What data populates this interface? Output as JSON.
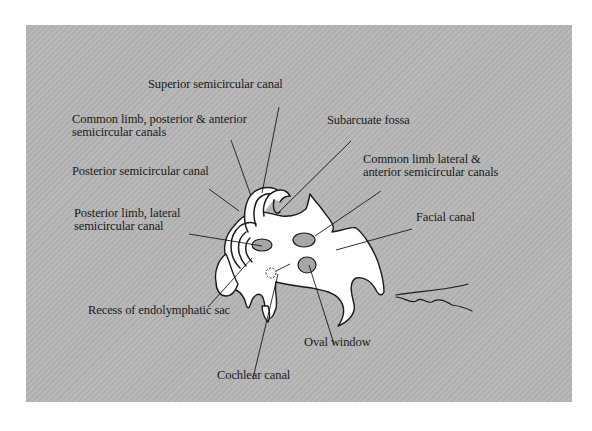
{
  "figure": {
    "panel_color": "#b5b5b5",
    "bone_color": "#ffffff",
    "outline_color": "#1a1a1a",
    "cavity_color": "#9a9a9a"
  },
  "labels": [
    {
      "id": "superior-semicircular-canal",
      "lines": [
        "Superior semicircular canal"
      ],
      "x": 148,
      "y": 88,
      "leader": [
        279,
        107,
        262,
        193
      ]
    },
    {
      "id": "common-limb-posterior-anterior",
      "lines": [
        "Common limb, posterior &  anterior",
        "semicircular canals"
      ],
      "x": 72,
      "y": 123,
      "leader": [
        231,
        140,
        251,
        196
      ]
    },
    {
      "id": "subarcuate-fossa",
      "lines": [
        "Subarcuate fossa"
      ],
      "x": 327,
      "y": 124,
      "leader": [
        351,
        141,
        278,
        213
      ]
    },
    {
      "id": "common-limb-lateral-anterior",
      "lines": [
        "Common limb lateral &",
        "anterior semicircular canals"
      ],
      "x": 363,
      "y": 163,
      "leader": [
        381,
        191,
        315,
        236
      ]
    },
    {
      "id": "posterior-semicircular-canal",
      "lines": [
        "Posterior semicircular canal"
      ],
      "x": 72,
      "y": 175,
      "leader": [
        209,
        189,
        239,
        211
      ]
    },
    {
      "id": "posterior-limb-lateral",
      "lines": [
        "Posterior limb, lateral",
        "semicircular canal"
      ],
      "x": 74,
      "y": 217,
      "leader": [
        189,
        234,
        262,
        246
      ]
    },
    {
      "id": "facial-canal",
      "lines": [
        "Facial canal"
      ],
      "x": 416,
      "y": 221,
      "leader": [
        412,
        229,
        336,
        250
      ]
    },
    {
      "id": "recess-endolymphatic-sac",
      "lines": [
        "Recess of endolymphatic sac"
      ],
      "x": 88,
      "y": 314,
      "leader": [
        208,
        307,
        252,
        258
      ]
    },
    {
      "id": "oval-window",
      "lines": [
        "Oval window"
      ],
      "x": 304,
      "y": 346,
      "leader": [
        334,
        344,
        309,
        265
      ]
    },
    {
      "id": "cochlear-canal",
      "lines": [
        "Cochlear canal"
      ],
      "x": 217,
      "y": 379,
      "leader": [
        253,
        378,
        278,
        274
      ]
    }
  ]
}
